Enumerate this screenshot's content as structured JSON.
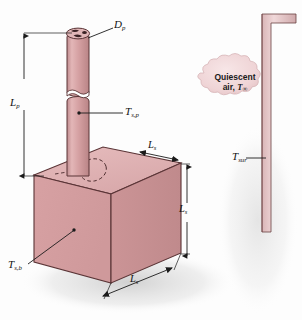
{
  "figure": {
    "background_color": "#fdfdfd",
    "solid_fill_front": "#d8a2a4",
    "solid_fill_top": "#e0b3b4",
    "solid_fill_side": "#cf9597",
    "pin_fill": "#d7a1a3",
    "wall_fill": "#e7c6c8",
    "outline_color": "#4a2a2c",
    "shadow_color": "#d7d7d7"
  },
  "labels": {
    "pin_diameter": {
      "symbol": "D",
      "sub": "p",
      "name": "pin diameter"
    },
    "pin_length": {
      "symbol": "L",
      "sub": "p",
      "name": "pin length"
    },
    "pin_surface_temp": {
      "symbol": "T",
      "sub": "s,p",
      "name": "pin surface temperature"
    },
    "base_surface_temp": {
      "symbol": "T",
      "sub": "s,b",
      "name": "base surface temperature"
    },
    "base_side_top": {
      "symbol": "L",
      "sub": "s",
      "name": "base side length top"
    },
    "base_side_vertical": {
      "symbol": "L",
      "sub": "s",
      "name": "base side length vertical"
    },
    "base_side_bottom": {
      "symbol": "L",
      "sub": "s",
      "name": "base side length bottom"
    },
    "surroundings_temp": {
      "symbol": "T",
      "sub": "sur",
      "name": "surroundings temperature"
    }
  },
  "callout": {
    "line1": "Quiescent",
    "line2_prefix": "air, ",
    "line2_symbol": "T",
    "line2_sub": "∞"
  }
}
